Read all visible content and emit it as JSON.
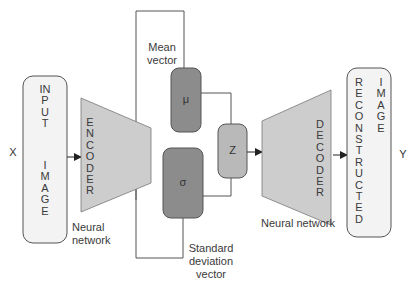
{
  "diagram": {
    "type": "variational-autoencoder",
    "input_symbol": "X",
    "output_symbol": "Y",
    "input_box": {
      "label_line1": "INPUT",
      "label_line2": "IMAGE"
    },
    "encoder": {
      "label": "ENCODER",
      "caption": "Neural network"
    },
    "mean": {
      "symbol": "μ",
      "caption": "Mean vector"
    },
    "std": {
      "symbol": "σ",
      "caption": "Standard deviation vector"
    },
    "latent": {
      "symbol": "Z"
    },
    "decoder": {
      "label": "DECODER",
      "caption": "Neural network"
    },
    "output_box": {
      "label_line1": "RECONSTRUCTED",
      "label_line2": "IMAGE"
    },
    "colors": {
      "io_box_fill": "#f3f3f3",
      "network_fill": "#cdcdcd",
      "mu_sigma_fill": "#8c8c8c",
      "z_fill": "#b9b9b9",
      "stroke": "#555555"
    }
  }
}
